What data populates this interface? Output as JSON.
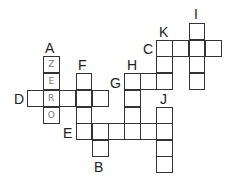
{
  "puzzle": {
    "type": "crossword",
    "cell_px": 16.5,
    "col_x": [
      27,
      43,
      59,
      75.5,
      92,
      108,
      124,
      140,
      156,
      172,
      188.5,
      205
    ],
    "row_y": [
      23,
      40,
      56,
      73,
      90,
      107,
      123,
      140,
      156
    ],
    "entries": [
      {
        "label": "A",
        "dir": "down",
        "col": 1,
        "row": 2,
        "len": 4,
        "letters": [
          "Z",
          "E",
          "R",
          "O"
        ],
        "label_x": 45,
        "label_y": 41
      },
      {
        "label": "B",
        "dir": "cell",
        "col": 4,
        "row": 7,
        "len": 1,
        "letters": [],
        "label_x": 94,
        "label_y": 160
      },
      {
        "label": "C",
        "dir": "across",
        "col": 8,
        "row": 1,
        "len": 4,
        "letters": [],
        "label_x": 143,
        "label_y": 42
      },
      {
        "label": "D",
        "dir": "across",
        "col": 0,
        "row": 4,
        "len": 5,
        "letters": [],
        "label_x": 14,
        "label_y": 92
      },
      {
        "label": "E",
        "dir": "across",
        "col": 3,
        "row": 6,
        "len": 6,
        "letters": [],
        "label_x": 63,
        "label_y": 126
      },
      {
        "label": "F",
        "dir": "down",
        "col": 3,
        "row": 3,
        "len": 4,
        "letters": [],
        "label_x": 78,
        "label_y": 58
      },
      {
        "label": "G",
        "dir": "across",
        "col": 6,
        "row": 3,
        "len": 3,
        "letters": [],
        "label_x": 110,
        "label_y": 76
      },
      {
        "label": "H",
        "dir": "down",
        "col": 6,
        "row": 3,
        "len": 4,
        "letters": [],
        "label_x": 127,
        "label_y": 58
      },
      {
        "label": "I",
        "dir": "down",
        "col": 10,
        "row": 0,
        "len": 4,
        "letters": [],
        "label_x": 194,
        "label_y": 7
      },
      {
        "label": "J",
        "dir": "down",
        "col": 8,
        "row": 5,
        "len": 4,
        "letters": [],
        "label_x": 160,
        "label_y": 92
      },
      {
        "label": "K",
        "dir": "down",
        "col": 8,
        "row": 1,
        "len": 3,
        "letters": [],
        "label_x": 159,
        "label_y": 25
      }
    ]
  }
}
